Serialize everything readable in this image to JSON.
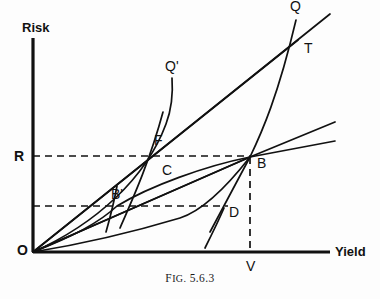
{
  "figure": {
    "caption_prefix": "F",
    "caption_smallcaps": "IG.",
    "caption_number": "5.6.3",
    "caption_full": "FIG. 5.6.3",
    "background_color": "#fdfdfd",
    "ink_color": "#111111"
  },
  "axes": {
    "y_label": "Risk",
    "x_label": "Yield",
    "origin_label": "O",
    "axis_color": "#111111",
    "y_axis": {
      "x": 33,
      "y_top": 38,
      "y_bottom": 252
    },
    "x_axis": {
      "y": 252,
      "x_left": 33,
      "x_right": 330
    }
  },
  "guides": {
    "dashed_color": "#111111",
    "horizontal": [
      {
        "name": "R-level",
        "y": 156,
        "x_start": 33,
        "x_end": 250,
        "tick_label": "R"
      },
      {
        "name": "B-prime-level",
        "y": 206,
        "x_start": 33,
        "x_end": 228,
        "tick_label": ""
      }
    ],
    "vertical": [
      {
        "name": "B-to-V",
        "x": 250,
        "y_start": 157,
        "y_end": 252,
        "foot_label": "V"
      }
    ]
  },
  "points": [
    {
      "id": "Q",
      "label": "Q",
      "x": 296,
      "y": 14,
      "label_dx": -6,
      "label_dy": -8
    },
    {
      "id": "T",
      "label": "T",
      "x": 298,
      "y": 40,
      "label_dx": 6,
      "label_dy": 8
    },
    {
      "id": "Qp",
      "label": "Q'",
      "x": 172,
      "y": 78,
      "label_dx": -7,
      "label_dy": -12
    },
    {
      "id": "F",
      "label": "F",
      "x": 158,
      "y": 152,
      "label_dx": -4,
      "label_dy": -12
    },
    {
      "id": "C",
      "label": "C",
      "x": 162,
      "y": 166,
      "label_dx": 0,
      "label_dy": 4
    },
    {
      "id": "R",
      "label": "R",
      "x": 33,
      "y": 156,
      "label_dx": -19,
      "label_dy": 0
    },
    {
      "id": "B",
      "label": "B",
      "x": 250,
      "y": 157,
      "label_dx": 7,
      "label_dy": 6
    },
    {
      "id": "Bp",
      "label": "B'",
      "x": 117,
      "y": 206,
      "label_dx": -6,
      "label_dy": -12
    },
    {
      "id": "D",
      "label": "D",
      "x": 222,
      "y": 210,
      "label_dx": 7,
      "label_dy": 2
    },
    {
      "id": "V",
      "label": "V",
      "x": 250,
      "y": 252,
      "label_dx": -4,
      "label_dy": 14
    },
    {
      "id": "O",
      "label": "O",
      "x": 33,
      "y": 252,
      "label_dx": -16,
      "label_dy": -2
    }
  ],
  "curves": {
    "stroke_color": "#111111",
    "rays_from_origin": [
      {
        "name": "ray-O-to-Q",
        "d": "M33,252 L330,14"
      },
      {
        "name": "ray-O-to-T-B",
        "d": "M33,252 L298,40"
      },
      {
        "name": "ray-O-through-B-upper",
        "d": "M33,252 L250,157 L335,122"
      },
      {
        "name": "ray-O-through-B-lower",
        "d": "M33,252 L250,157 L335,141"
      }
    ],
    "steep_curves": [
      {
        "name": "curve-O-to-Q-prime",
        "d": "M33,252 C 96,224 146,178 166,124 C 172,108 173,92 172,78"
      },
      {
        "name": "curve-through-F-steep",
        "d": "M120,228 C 134,196 150,160 163,112"
      },
      {
        "name": "curve-through-B-steep",
        "d": "M210,232 C 224,206 238,180 250,157 C 262,132 278,96 296,20"
      },
      {
        "name": "curve-short-left-of-Bprime",
        "d": "M106,232 C 110,218 114,202 117,186"
      }
    ],
    "flat_curves": [
      {
        "name": "curve-O-through-Bprime-to-B",
        "d": "M33,252 C 70,238 100,222 117,206 C 150,186 205,166 250,157"
      },
      {
        "name": "curve-O-through-D-to-B",
        "d": "M33,252 C 82,244 140,230 180,218 C 205,210 232,180 250,157"
      },
      {
        "name": "curve-D-tail",
        "d": "M205,248 C 212,234 218,222 224,208"
      }
    ]
  }
}
